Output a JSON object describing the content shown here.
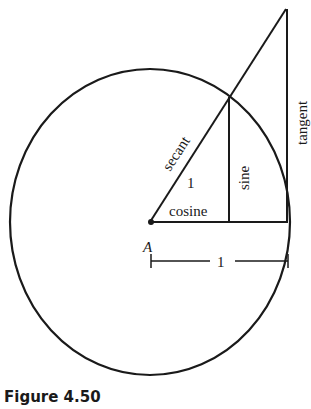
{
  "figure": {
    "caption": "Figure 4.50",
    "center_label": "A",
    "labels": {
      "secant": "secant",
      "sine": "sine",
      "tangent": "tangent",
      "cosine": "cosine",
      "radius": "1",
      "unit_measure": "1"
    }
  }
}
